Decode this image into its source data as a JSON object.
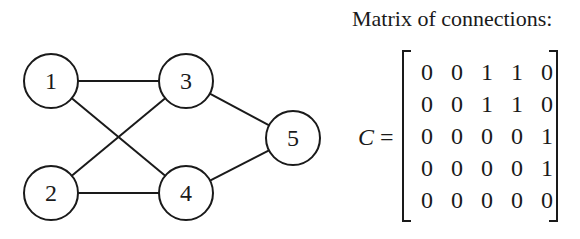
{
  "diagram": {
    "nodes": [
      {
        "id": "1",
        "label": "1",
        "x": 51,
        "y": 81
      },
      {
        "id": "2",
        "label": "2",
        "x": 51,
        "y": 193
      },
      {
        "id": "3",
        "label": "3",
        "x": 186,
        "y": 81
      },
      {
        "id": "4",
        "label": "4",
        "x": 186,
        "y": 193
      },
      {
        "id": "5",
        "label": "5",
        "x": 293,
        "y": 138
      }
    ],
    "edges": [
      {
        "from": "1",
        "to": "3"
      },
      {
        "from": "1",
        "to": "4"
      },
      {
        "from": "2",
        "to": "3"
      },
      {
        "from": "2",
        "to": "4"
      },
      {
        "from": "3",
        "to": "5"
      },
      {
        "from": "4",
        "to": "5"
      }
    ],
    "node_radius": 27
  },
  "matrix": {
    "title": "Matrix of connections:",
    "symbol": "C",
    "equals": "=",
    "rows": [
      [
        0,
        0,
        1,
        1,
        0
      ],
      [
        0,
        0,
        1,
        1,
        0
      ],
      [
        0,
        0,
        0,
        0,
        1
      ],
      [
        0,
        0,
        0,
        0,
        1
      ],
      [
        0,
        0,
        0,
        0,
        0
      ]
    ]
  }
}
